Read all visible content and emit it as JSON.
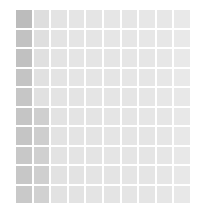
{
  "figure": {
    "title": "",
    "background_color": "#ffffff",
    "gridline_color": "#ffffff"
  },
  "chart_data": {
    "type": "heatmap",
    "title": "",
    "subtitle": "",
    "xlabel": "",
    "ylabel": "",
    "grid": true,
    "legend": "none",
    "colormap": "greys",
    "rows": 10,
    "columns": 10,
    "x": [
      "1",
      "2",
      "3",
      "4",
      "5",
      "6",
      "7",
      "8",
      "9",
      "10"
    ],
    "y": [
      "1",
      "2",
      "3",
      "4",
      "5",
      "6",
      "7",
      "8",
      "9",
      "10"
    ],
    "xtick_labels": [],
    "ytick_labels": [],
    "annotations": [],
    "vmin": 0,
    "vmax": 1,
    "values": [
      [
        0.45,
        0.18,
        0.13,
        0.12,
        0.12,
        0.11,
        0.11,
        0.1,
        0.1,
        0.09
      ],
      [
        0.4,
        0.17,
        0.13,
        0.12,
        0.12,
        0.11,
        0.11,
        0.1,
        0.1,
        0.09
      ],
      [
        0.41,
        0.16,
        0.13,
        0.12,
        0.12,
        0.12,
        0.11,
        0.11,
        0.1,
        0.09
      ],
      [
        0.38,
        0.15,
        0.13,
        0.12,
        0.12,
        0.12,
        0.11,
        0.11,
        0.1,
        0.09
      ],
      [
        0.36,
        0.15,
        0.13,
        0.13,
        0.12,
        0.12,
        0.12,
        0.11,
        0.1,
        0.1
      ],
      [
        0.37,
        0.3,
        0.14,
        0.13,
        0.13,
        0.12,
        0.12,
        0.11,
        0.11,
        0.1
      ],
      [
        0.37,
        0.31,
        0.14,
        0.13,
        0.13,
        0.12,
        0.12,
        0.12,
        0.11,
        0.1
      ],
      [
        0.34,
        0.29,
        0.14,
        0.13,
        0.13,
        0.12,
        0.12,
        0.12,
        0.11,
        0.1
      ],
      [
        0.35,
        0.3,
        0.15,
        0.14,
        0.13,
        0.13,
        0.12,
        0.12,
        0.11,
        0.1
      ],
      [
        0.33,
        0.28,
        0.15,
        0.14,
        0.13,
        0.13,
        0.12,
        0.12,
        0.11,
        0.1
      ]
    ],
    "cell_colors": [
      [
        "#bcbcbc",
        "#dedede",
        "#e4e4e4",
        "#e5e5e5",
        "#e5e5e5",
        "#e6e6e6",
        "#e6e6e6",
        "#e7e7e7",
        "#e7e7e7",
        "#e9e9e9"
      ],
      [
        "#c2c2c2",
        "#dfdfdf",
        "#e4e4e4",
        "#e5e5e5",
        "#e5e5e5",
        "#e6e6e6",
        "#e6e6e6",
        "#e7e7e7",
        "#e7e7e7",
        "#e9e9e9"
      ],
      [
        "#c1c1c1",
        "#e0e0e0",
        "#e4e4e4",
        "#e5e5e5",
        "#e5e5e5",
        "#e5e5e5",
        "#e6e6e6",
        "#e6e6e6",
        "#e7e7e7",
        "#e9e9e9"
      ],
      [
        "#c4c4c4",
        "#e1e1e1",
        "#e4e4e4",
        "#e5e5e5",
        "#e5e5e5",
        "#e5e5e5",
        "#e6e6e6",
        "#e6e6e6",
        "#e7e7e7",
        "#e9e9e9"
      ],
      [
        "#c6c6c6",
        "#e1e1e1",
        "#e4e4e4",
        "#e4e4e4",
        "#e5e5e5",
        "#e5e5e5",
        "#e5e5e5",
        "#e6e6e6",
        "#e7e7e7",
        "#e8e8e8"
      ],
      [
        "#c5c5c5",
        "#cfcfcf",
        "#e3e3e3",
        "#e4e4e4",
        "#e4e4e4",
        "#e5e5e5",
        "#e5e5e5",
        "#e6e6e6",
        "#e6e6e6",
        "#e8e8e8"
      ],
      [
        "#c5c5c5",
        "#cecece",
        "#e3e3e3",
        "#e4e4e4",
        "#e4e4e4",
        "#e5e5e5",
        "#e5e5e5",
        "#e5e5e5",
        "#e6e6e6",
        "#e8e8e8"
      ],
      [
        "#c8c8c8",
        "#d0d0d0",
        "#e3e3e3",
        "#e4e4e4",
        "#e4e4e4",
        "#e5e5e5",
        "#e5e5e5",
        "#e5e5e5",
        "#e6e6e6",
        "#e8e8e8"
      ],
      [
        "#c7c7c7",
        "#cfcfcf",
        "#e2e2e2",
        "#e3e3e3",
        "#e4e4e4",
        "#e4e4e4",
        "#e5e5e5",
        "#e5e5e5",
        "#e6e6e6",
        "#e8e8e8"
      ],
      [
        "#c9c9c9",
        "#d1d1d1",
        "#e2e2e2",
        "#e3e3e3",
        "#e4e4e4",
        "#e4e4e4",
        "#e5e5e5",
        "#e5e5e5",
        "#e6e6e6",
        "#e8e8e8"
      ]
    ]
  }
}
